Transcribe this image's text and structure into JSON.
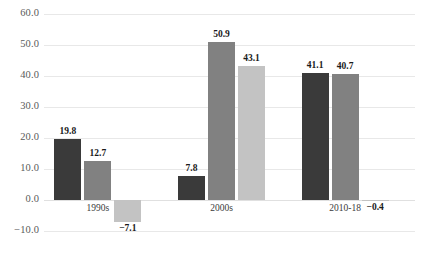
{
  "chart_data": {
    "type": "bar",
    "title": "",
    "subtitle": "",
    "xlabel": "",
    "ylabel": "",
    "categories": [
      "1990s",
      "2000s",
      "2010-18"
    ],
    "series": [
      {
        "name": "series-1",
        "color": "#3a3a3a",
        "values": [
          19.8,
          7.8,
          41.1
        ]
      },
      {
        "name": "series-2",
        "color": "#818181",
        "values": [
          12.7,
          50.9,
          40.7
        ]
      },
      {
        "name": "series-3",
        "color": "#c3c3c3",
        "values": [
          -7.1,
          43.1,
          -0.4
        ]
      }
    ],
    "value_labels": [
      [
        "19.8",
        "7.8",
        "41.1"
      ],
      [
        "12.7",
        "50.9",
        "40.7"
      ],
      [
        "−7.1",
        "43.1",
        "−0.4"
      ]
    ],
    "yticks": [
      60.0,
      50.0,
      40.0,
      30.0,
      20.0,
      10.0,
      0.0,
      -10.0
    ],
    "ytick_labels": [
      "60.0",
      "50.0",
      "40.0",
      "30.0",
      "20.0",
      "10.0",
      "0.0",
      "−10.0"
    ],
    "ylim": [
      -10.0,
      60.0
    ],
    "grid": true,
    "legend": "none",
    "data_labels": true
  }
}
